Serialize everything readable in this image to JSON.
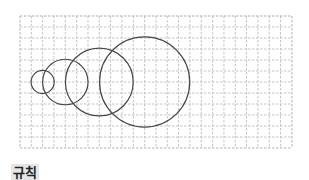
{
  "figure": {
    "grid": {
      "x": 20,
      "y": 16,
      "cols": 24,
      "rows": 12,
      "cell_w": 11.33,
      "cell_h": 11,
      "line_color": "#c4c4c4",
      "border_color": "#b0b0b0"
    },
    "circles": [
      {
        "cx_cells": 2,
        "r_cells": 1
      },
      {
        "cx_cells": 4,
        "r_cells": 2
      },
      {
        "cx_cells": 7,
        "r_cells": 3
      },
      {
        "cx_cells": 11,
        "r_cells": 4
      }
    ],
    "circle_cy_cells": 6,
    "circle_color": "#474747"
  },
  "label": {
    "text": "규칙"
  }
}
